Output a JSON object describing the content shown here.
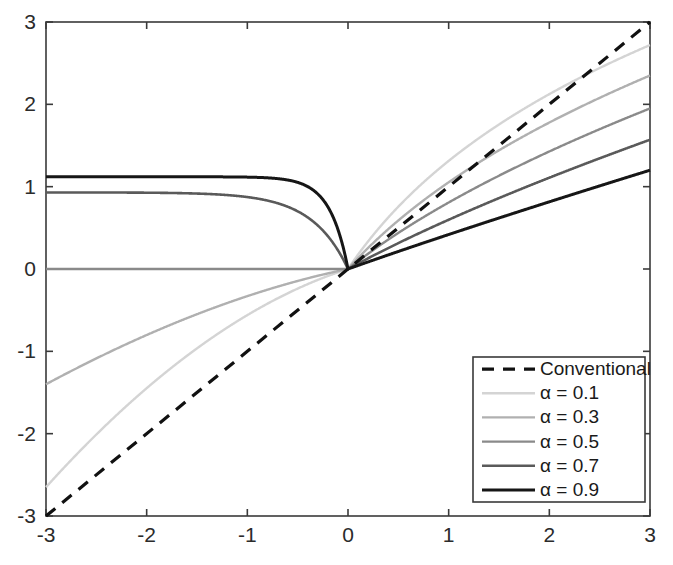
{
  "chart_data": {
    "type": "line",
    "title": "",
    "subtitle": "",
    "xlabel": "",
    "ylabel": "",
    "xlim": [
      -3,
      3
    ],
    "ylim": [
      -3,
      3
    ],
    "xticks": [
      -3,
      -2,
      -1,
      0,
      1,
      2,
      3
    ],
    "yticks": [
      -3,
      -2,
      -1,
      0,
      1,
      2,
      3
    ],
    "xtick_labels": [
      "-3",
      "-2",
      "-1",
      "0",
      "1",
      "2",
      "3"
    ],
    "ytick_labels": [
      "-3",
      "-2",
      "-1",
      "0",
      "1",
      "2",
      "3"
    ],
    "grid": false,
    "legend_position": "lower right",
    "background_color": "#ffffff",
    "axis_color": "#3a3a3a",
    "series": [
      {
        "name": "Conventional",
        "legend_label": "Conventional",
        "alpha": null,
        "color": "#111111",
        "line_style": "dashed",
        "line_width": 3.2,
        "dash_pattern": "12,9",
        "x": [
          -3,
          -2,
          -1,
          0,
          1,
          2,
          3
        ],
        "values": [
          -3,
          -2,
          -1,
          0,
          1,
          2,
          3
        ],
        "endpoint_left": -3,
        "endpoint_right": 3
      },
      {
        "name": "alpha-0.1",
        "legend_label": "α = 0.1",
        "alpha": 0.1,
        "color": "#d4d4d4",
        "line_style": "solid",
        "line_width": 2.4,
        "dash_pattern": "",
        "x": [
          -3,
          -2.5,
          -2,
          -1.5,
          -1,
          -0.5,
          0,
          0.5,
          1,
          1.5,
          2,
          2.5,
          3
        ],
        "values": [
          -2.65,
          -2.25,
          -1.83,
          -1.4,
          -0.95,
          -0.49,
          0,
          0.48,
          1.0,
          1.53,
          2.03,
          2.39,
          2.72
        ],
        "endpoint_left": -2.65,
        "endpoint_right": 2.72
      },
      {
        "name": "alpha-0.3",
        "legend_label": "α = 0.3",
        "alpha": 0.3,
        "color": "#b0b0b0",
        "line_style": "solid",
        "line_width": 2.4,
        "dash_pattern": "",
        "x": [
          -3,
          -2.5,
          -2,
          -1.5,
          -1,
          -0.5,
          0,
          0.5,
          1,
          1.5,
          2,
          2.5,
          3
        ],
        "values": [
          -1.4,
          -1.24,
          -1.05,
          -0.85,
          -0.61,
          -0.33,
          0,
          0.42,
          1.0,
          1.46,
          1.82,
          2.11,
          2.35
        ],
        "endpoint_left": -1.4,
        "endpoint_right": 2.35
      },
      {
        "name": "alpha-0.5",
        "legend_label": "α = 0.5",
        "alpha": 0.5,
        "color": "#8a8a8a",
        "line_style": "solid",
        "line_width": 2.4,
        "dash_pattern": "",
        "x": [
          -3,
          -2.5,
          -2,
          -1.5,
          -1,
          -0.5,
          0,
          0.5,
          1,
          1.5,
          2,
          2.5,
          3
        ],
        "values": [
          0.0,
          0.0,
          0.0,
          0.0,
          0.0,
          0.0,
          0,
          0.45,
          1.0,
          1.3,
          1.55,
          1.76,
          1.95
        ],
        "endpoint_left": 0.0,
        "endpoint_right": 1.95
      },
      {
        "name": "alpha-0.7",
        "legend_label": "α = 0.7",
        "alpha": 0.7,
        "color": "#5a5a5a",
        "line_style": "solid",
        "line_width": 2.6,
        "dash_pattern": "",
        "x": [
          -3,
          -2.5,
          -2,
          -1.5,
          -1,
          -0.5,
          0,
          0.5,
          1,
          1.5,
          2,
          2.5,
          3
        ],
        "values": [
          0.93,
          0.9,
          0.86,
          0.81,
          0.73,
          0.6,
          0,
          0.47,
          1.0,
          1.2,
          1.36,
          1.47,
          1.57
        ],
        "endpoint_left": 0.93,
        "endpoint_right": 1.57
      },
      {
        "name": "alpha-0.9",
        "legend_label": "α = 0.9",
        "alpha": 0.9,
        "color": "#161616",
        "line_style": "solid",
        "line_width": 3.0,
        "dash_pattern": "",
        "x": [
          -3,
          -2.5,
          -2,
          -1.5,
          -1,
          -0.5,
          0,
          0.5,
          1,
          1.5,
          2,
          2.5,
          3
        ],
        "values": [
          1.12,
          1.11,
          1.1,
          1.08,
          1.04,
          0.96,
          0,
          0.48,
          1.0,
          1.08,
          1.13,
          1.17,
          1.2
        ],
        "endpoint_left": 1.12,
        "endpoint_right": 1.2
      }
    ]
  },
  "plot_geometry": {
    "left": 46,
    "top": 22,
    "right": 650,
    "bottom": 516
  },
  "legend": {
    "x": 473,
    "y": 357,
    "width": 172,
    "height": 145
  }
}
